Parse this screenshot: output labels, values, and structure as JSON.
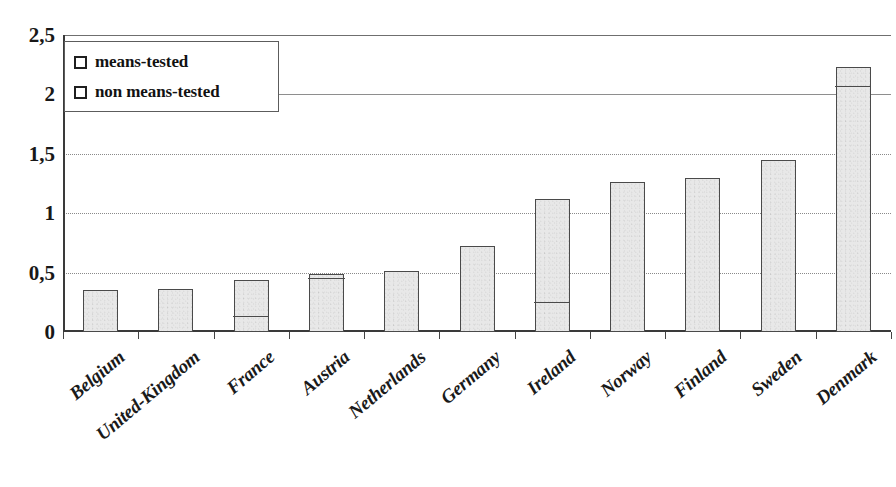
{
  "chart_data": {
    "type": "bar",
    "title": "",
    "subtitle": "",
    "xlabel": "",
    "ylabel": "",
    "ylim": [
      0,
      2.5
    ],
    "yticks": [
      0,
      0.5,
      1,
      1.5,
      2,
      2.5
    ],
    "ytick_labels": [
      "0",
      "0,5",
      "1",
      "1,5",
      "2",
      "2,5"
    ],
    "grid": true,
    "grid_axis": "y",
    "stacked": true,
    "legend_position": "top-left",
    "decimal_separator": ",",
    "categories": [
      "Belgium",
      "United-Kingdom",
      "France",
      "Austria",
      "Netherlands",
      "Germany",
      "Ireland",
      "Norway",
      "Finland",
      "Sweden",
      "Denmark"
    ],
    "series": [
      {
        "name": "means-tested",
        "values": [
          0,
          0,
          0.12,
          0.44,
          0,
          0,
          0.24,
          0,
          0,
          0,
          2.05
        ]
      },
      {
        "name": "non means-tested",
        "values": [
          0.35,
          0.36,
          0.32,
          0.05,
          0.51,
          0.72,
          0.88,
          1.26,
          1.3,
          1.45,
          0.18
        ]
      }
    ],
    "totals": [
      0.35,
      0.36,
      0.44,
      0.49,
      0.51,
      0.72,
      1.12,
      1.26,
      1.3,
      1.45,
      2.23
    ]
  },
  "legend": {
    "items": [
      {
        "label": "means-tested",
        "swatch": "open-square"
      },
      {
        "label": "non means-tested",
        "swatch": "open-square"
      }
    ]
  },
  "colors": {
    "bar_fill": "#e8e8e8",
    "bar_outline": "#4a4a4a",
    "gridline": "#8e8e8e",
    "axis": "#3a3a3a",
    "text": "#1a1a1a",
    "background": "#ffffff"
  }
}
